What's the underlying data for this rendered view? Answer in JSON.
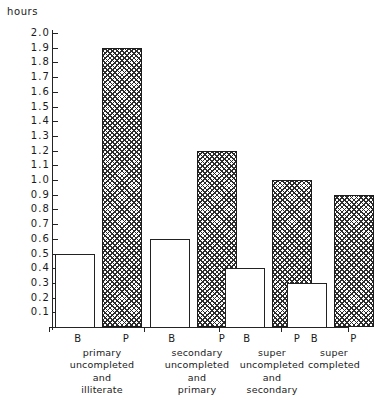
{
  "chart_data": {
    "type": "bar",
    "title": "",
    "subtitle": "",
    "xlabel": "",
    "ylabel": "hours",
    "ylim": [
      0.0,
      2.0
    ],
    "ytick_step": 0.1,
    "grid": false,
    "legend_position": "none",
    "ytick_labels": [
      "2.0",
      "1.9",
      "1.8",
      "1.7",
      "1.6",
      "1.5",
      "1.4",
      "1.3",
      "1.2",
      "1.1",
      "1.0",
      "0.9",
      "0.8",
      "0.7",
      "0.6",
      "0.5",
      "0.4",
      "0.3",
      "0.2",
      "0.1"
    ],
    "ytick_values": [
      2.0,
      1.9,
      1.8,
      1.7,
      1.6,
      1.5,
      1.4,
      1.3,
      1.2,
      1.1,
      1.0,
      0.9,
      0.8,
      0.7,
      0.6,
      0.5,
      0.4,
      0.3,
      0.2,
      0.1
    ],
    "categories": [
      "primary uncompleted and illiterate",
      "secondary uncompleted and primary",
      "super uncompleted and secondary",
      "super completed"
    ],
    "category_lines": [
      [
        "primary",
        "uncompleted",
        "and",
        "illiterate"
      ],
      [
        "secondary",
        "uncompleted",
        "and",
        "primary"
      ],
      [
        "super",
        "uncompleted",
        "and",
        "secondary"
      ],
      [
        "super",
        "completed"
      ]
    ],
    "series": [
      {
        "name": "B",
        "key": "B",
        "style": "open",
        "values": [
          0.5,
          0.6,
          0.4,
          0.3
        ]
      },
      {
        "name": "P",
        "key": "P",
        "style": "cross-hatched",
        "values": [
          1.9,
          1.2,
          1.0,
          0.9
        ]
      }
    ]
  },
  "axis": {
    "unit_label": "hours"
  },
  "groups": [
    {
      "b_key": "B",
      "p_key": "P",
      "b_value": 0.5,
      "p_value": 1.9,
      "lines": [
        "primary",
        "uncompleted",
        "and",
        "illiterate"
      ]
    },
    {
      "b_key": "B",
      "p_key": "P",
      "b_value": 0.6,
      "p_value": 1.2,
      "lines": [
        "secondary",
        "uncompleted",
        "and",
        "primary"
      ]
    },
    {
      "b_key": "B",
      "p_key": "P",
      "b_value": 0.4,
      "p_value": 1.0,
      "lines": [
        "super",
        "uncompleted",
        "and",
        "secondary"
      ]
    },
    {
      "b_key": "B",
      "p_key": "P",
      "b_value": 0.3,
      "p_value": 0.9,
      "lines": [
        "super",
        "completed"
      ]
    }
  ],
  "colors": {
    "ink": "#242424",
    "background": "#ffffff",
    "hatch": "#2b2b2b"
  }
}
